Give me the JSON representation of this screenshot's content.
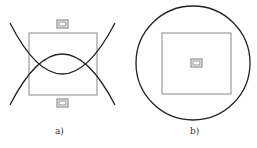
{
  "figure": {
    "panels": [
      {
        "id": "a",
        "label": "a)",
        "description": "Square frame with two intersecting circular arcs and two small marker boxes above and below"
      },
      {
        "id": "b",
        "label": "b)",
        "description": "Square frame inside a circle with a small marker box at center"
      }
    ]
  },
  "colors": {
    "arc": "#222222",
    "frame": "#888888",
    "marker": "#777777",
    "background": "#ffffff"
  }
}
